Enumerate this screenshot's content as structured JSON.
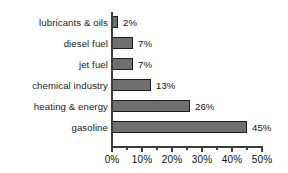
{
  "chart_data": {
    "type": "bar",
    "orientation": "horizontal",
    "title": "",
    "subtitle": "",
    "xlabel": "",
    "ylabel": "",
    "categories": [
      "lubricants & oils",
      "diesel fuel",
      "jet fuel",
      "chemical industry",
      "heating & energy",
      "gasoline"
    ],
    "values": [
      2,
      7,
      7,
      13,
      26,
      45
    ],
    "data_labels": [
      "2%",
      "7%",
      "7%",
      "13%",
      "26%",
      "45%"
    ],
    "xlim": [
      0,
      50
    ],
    "xtick_values": [
      0,
      10,
      20,
      30,
      40,
      50
    ],
    "xtick_labels": [
      "0%",
      "10%",
      "20%",
      "30%",
      "40%",
      "50%"
    ],
    "minor_tick_values": [
      5,
      15,
      25,
      35,
      45
    ],
    "grid": false,
    "legend": null,
    "units": "percent",
    "colors": {
      "bar_fill": "#6f6f6f",
      "bar_border": "#1c1c1c",
      "axis": "#3d3d3d",
      "text": "#111111",
      "background": "#ffffff"
    }
  }
}
